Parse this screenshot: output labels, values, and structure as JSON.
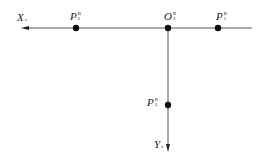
{
  "diagram": {
    "axes": {
      "x_axis": {
        "label": "X",
        "subscript": "s",
        "direction": "left"
      },
      "y_axis": {
        "label": "Y",
        "subscript": "s",
        "direction": "down"
      }
    },
    "points": [
      {
        "id": "P2",
        "base": "P",
        "sup": "R",
        "sub": "2",
        "position": "on x-axis, left of origin"
      },
      {
        "id": "O2",
        "base": "O",
        "sup": "R",
        "sub": "2",
        "position": "origin"
      },
      {
        "id": "P1",
        "base": "P",
        "sup": "R",
        "sub": "1",
        "position": "on x-axis, right of origin"
      },
      {
        "id": "P3",
        "base": "P",
        "sup": "R",
        "sub": "3",
        "position": "on y-axis, below origin"
      }
    ],
    "colors": {
      "line": "#555555",
      "dot": "#111111",
      "text": "#222222"
    }
  }
}
